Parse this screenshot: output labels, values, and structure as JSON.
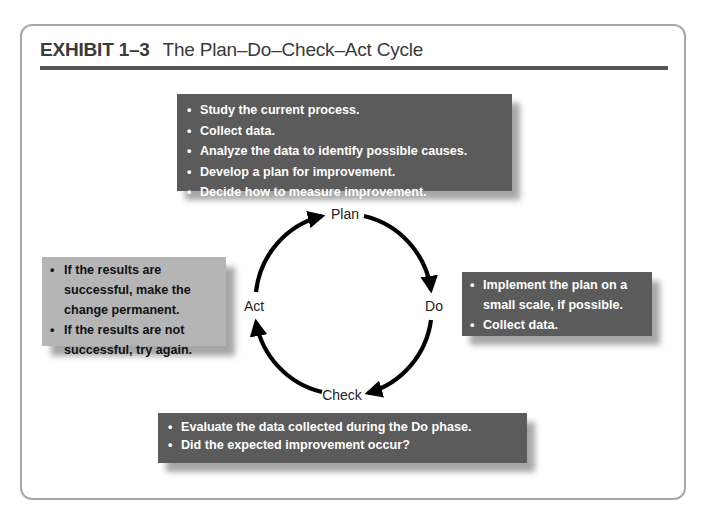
{
  "exhibit": {
    "number": "EXHIBIT 1–3",
    "title": "The Plan–Do–Check–Act Cycle"
  },
  "cycle": {
    "labels": {
      "plan": "Plan",
      "do": "Do",
      "check": "Check",
      "act": "Act"
    },
    "direction": "clockwise"
  },
  "boxes": {
    "plan": {
      "style": "dark",
      "items": [
        "Study the current process.",
        "Collect data.",
        "Analyze the data to identify possible causes.",
        "Develop a plan for improvement.",
        "Decide how to measure improvement."
      ]
    },
    "do": {
      "style": "dark",
      "items": [
        "Implement the plan on a small scale, if possible.",
        "Collect data."
      ]
    },
    "check": {
      "style": "dark",
      "items": [
        "Evaluate the data collected during the Do phase.",
        "Did the expected improvement occur?"
      ]
    },
    "act": {
      "style": "light",
      "items": [
        "If the results are successful, make the change permanent.",
        "If the results are not successful, try again."
      ]
    }
  },
  "colors": {
    "dark_box": "#5b5b5b",
    "light_box": "#b5b5b5",
    "frame_border": "#a8a8a8",
    "title_rule": "#555555",
    "arrow": "#000000"
  }
}
